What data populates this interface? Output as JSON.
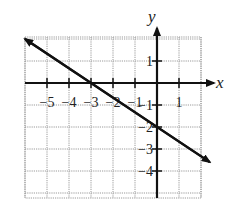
{
  "chart_data": {
    "type": "line",
    "title": "",
    "xlabel": "x",
    "ylabel": "y",
    "xlim": [
      -6,
      2
    ],
    "ylim": [
      -5,
      2
    ],
    "grid": true,
    "x_ticks": [
      -5,
      -4,
      -3,
      -2,
      -1,
      1
    ],
    "y_ticks": [
      1,
      -1,
      -2,
      -3,
      -4
    ],
    "x_tick_labels": [
      "−5",
      "−4",
      "−3",
      "−2",
      "−1",
      "1"
    ],
    "y_tick_labels": [
      "1",
      "−1",
      "−2",
      "−3",
      "−4"
    ],
    "series": [
      {
        "name": "y = -2/3 x - 2",
        "equation": "y = -(2/3)x - 2",
        "slope": -0.6667,
        "intercept": -2,
        "x_intercept": -3,
        "points": [
          [
            -6,
            2
          ],
          [
            -3,
            0
          ],
          [
            0,
            -2
          ],
          [
            2.4,
            -3.6
          ]
        ],
        "arrows": "both"
      }
    ]
  },
  "axes": {
    "x_name": "x",
    "y_name": "y"
  }
}
